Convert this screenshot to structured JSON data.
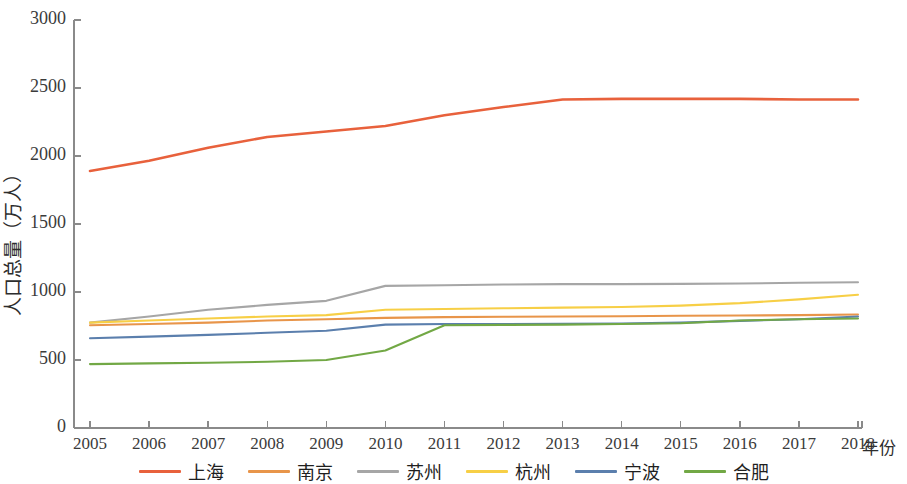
{
  "chart_data": {
    "type": "line",
    "title": "",
    "xlabel": "年份",
    "ylabel": "人口总量（万人）",
    "x": [
      2005,
      2006,
      2007,
      2008,
      2009,
      2010,
      2011,
      2012,
      2013,
      2014,
      2015,
      2016,
      2017,
      2018
    ],
    "xtick_labels": [
      "2005",
      "2006",
      "2007",
      "2008",
      "2009",
      "2010",
      "2011",
      "2012",
      "2013",
      "2014",
      "2015",
      "2016",
      "2017",
      "2018"
    ],
    "ytick_labels": [
      "0",
      "500",
      "1000",
      "1500",
      "2000",
      "2500",
      "3000"
    ],
    "yticks": [
      0,
      500,
      1000,
      1500,
      2000,
      2500,
      3000
    ],
    "ylim": [
      0,
      3000
    ],
    "xlim": [
      2005,
      2018
    ],
    "grid": false,
    "legend_position": "bottom",
    "series": [
      {
        "name": "上海",
        "color": "#e8613c",
        "values": [
          1890,
          1965,
          2060,
          2140,
          2180,
          2220,
          2300,
          2360,
          2415,
          2420,
          2420,
          2420,
          2415,
          2415
        ]
      },
      {
        "name": "南京",
        "color": "#e8954a",
        "values": [
          755,
          765,
          775,
          790,
          800,
          810,
          815,
          818,
          820,
          822,
          825,
          827,
          830,
          835
        ]
      },
      {
        "name": "苏州",
        "color": "#a6a6a6",
        "values": [
          775,
          820,
          870,
          905,
          935,
          1045,
          1050,
          1055,
          1058,
          1058,
          1060,
          1062,
          1068,
          1072
        ]
      },
      {
        "name": "杭州",
        "color": "#f7cf46",
        "values": [
          775,
          790,
          805,
          820,
          830,
          870,
          875,
          880,
          885,
          890,
          900,
          918,
          946,
          980
        ]
      },
      {
        "name": "宁波",
        "color": "#5b7fad",
        "values": [
          660,
          672,
          685,
          700,
          715,
          760,
          765,
          765,
          766,
          768,
          775,
          788,
          800,
          820
        ]
      },
      {
        "name": "合肥",
        "color": "#72a845",
        "values": [
          470,
          475,
          480,
          487,
          500,
          570,
          755,
          758,
          760,
          765,
          770,
          790,
          800,
          805
        ]
      }
    ]
  },
  "legend": {
    "items": [
      {
        "label": "上海",
        "color": "#e8613c"
      },
      {
        "label": "南京",
        "color": "#e8954a"
      },
      {
        "label": "苏州",
        "color": "#a6a6a6"
      },
      {
        "label": "杭州",
        "color": "#f7cf46"
      },
      {
        "label": "宁波",
        "color": "#5b7fad"
      },
      {
        "label": "合肥",
        "color": "#72a845"
      }
    ]
  },
  "axes": {
    "axis_color": "#8a8a8a",
    "x_title": "年份",
    "y_title": "人口总量（万人）"
  }
}
